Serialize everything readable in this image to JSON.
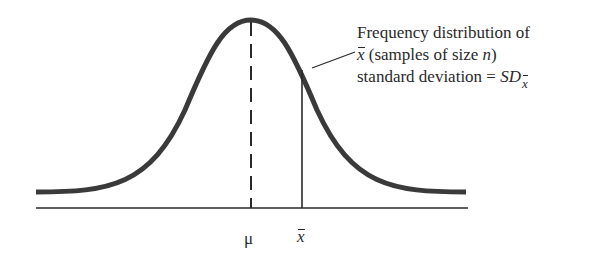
{
  "diagram": {
    "type": "normal-distribution-curve",
    "colors": {
      "curve": "#3a3a3a",
      "axis": "#2a2a2a",
      "text": "#2a2a2a",
      "background": "#ffffff"
    },
    "axis_labels": {
      "mean_symbol": "μ",
      "sample_mean_symbol": "x"
    },
    "annotation": {
      "line1": "Frequency distribution of",
      "line2_var": "x",
      "line2_rest": " (samples of size ",
      "line2_n": "n",
      "line2_close": ")",
      "line3_prefix": "standard deviation = ",
      "line3_sd": "SD",
      "line3_sub": "x"
    },
    "markers": {
      "mean_line_style": "dashed",
      "sample_mean_line_style": "solid"
    }
  }
}
